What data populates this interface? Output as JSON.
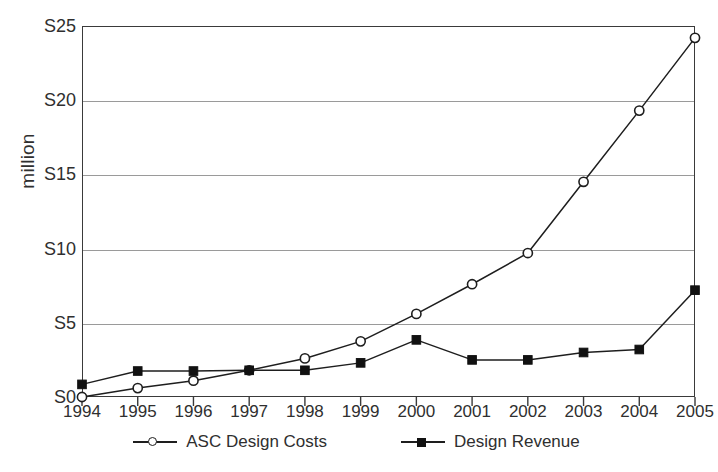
{
  "chart_data": {
    "type": "line",
    "title": "",
    "subtitle": "",
    "xlabel": "",
    "ylabel": "million",
    "categories": [
      "1994",
      "1995",
      "1996",
      "1997",
      "1998",
      "1999",
      "2000",
      "2001",
      "2002",
      "2003",
      "2004",
      "2005"
    ],
    "ylim": [
      0,
      25
    ],
    "ytick_values": [
      0,
      5,
      10,
      15,
      20,
      25
    ],
    "ytick_labels": [
      "S0",
      "S5",
      "S10",
      "S15",
      "S20",
      "S25"
    ],
    "grid": true,
    "legend_position": "bottom",
    "series": [
      {
        "name": "ASC Design Costs",
        "marker": "open-circle",
        "values": [
          0.0,
          0.6,
          1.1,
          1.8,
          2.6,
          3.75,
          5.6,
          7.6,
          9.7,
          14.5,
          19.3,
          24.2
        ]
      },
      {
        "name": "Design Revenue",
        "marker": "filled-square",
        "values": [
          0.85,
          1.75,
          1.75,
          1.8,
          1.8,
          2.3,
          3.85,
          2.5,
          2.5,
          3.0,
          3.2,
          7.2
        ]
      }
    ],
    "colors": {
      "series_line": "#1e1e1e",
      "gridline": "#9a9a9a",
      "axis": "#3a3a3a",
      "text": "#2f2f2f",
      "background": "#ffffff"
    }
  },
  "legend": {
    "entries": [
      {
        "label": "ASC Design Costs"
      },
      {
        "label": "Design Revenue"
      }
    ]
  }
}
